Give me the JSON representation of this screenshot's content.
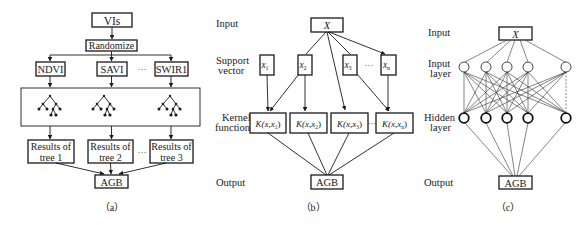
{
  "panel_a": {
    "caption": "（a）",
    "top": "VIs",
    "randomize": "Randomize",
    "features": [
      "NDVI",
      "SAVI",
      "SWIR1"
    ],
    "ellipsis": "···",
    "results": [
      {
        "line1": "Results of",
        "line2": "tree 1"
      },
      {
        "line1": "Results of",
        "line2": "tree 2"
      },
      {
        "line1": "Results of",
        "line2": "tree 3"
      }
    ],
    "output": "AGB"
  },
  "panel_b": {
    "caption": "（b）",
    "labels": {
      "input": "Input",
      "support_1": "Support",
      "support_2": "vector",
      "kernel_1": "Kernel",
      "kernel_2": "function",
      "output": "Output"
    },
    "input": "X",
    "support_vectors": [
      "x",
      "x",
      "x",
      "x"
    ],
    "support_subs": [
      "1",
      "2",
      "3",
      "n"
    ],
    "kernels": [
      "K(x,x",
      "K(x,x",
      "K(x,x",
      "K(x,x"
    ],
    "kernel_subs": [
      "1",
      "2",
      "3",
      "n"
    ],
    "ellipsis": "···",
    "output": "AGB"
  },
  "panel_c": {
    "caption": "（c）",
    "labels": {
      "input": "Input",
      "input_layer_1": "Input",
      "input_layer_2": "layer",
      "hidden_layer_1": "Hidden",
      "hidden_layer_2": "layer",
      "output": "Output"
    },
    "input": "X",
    "input_nodes": 5,
    "hidden_nodes": 5,
    "output": "AGB"
  }
}
